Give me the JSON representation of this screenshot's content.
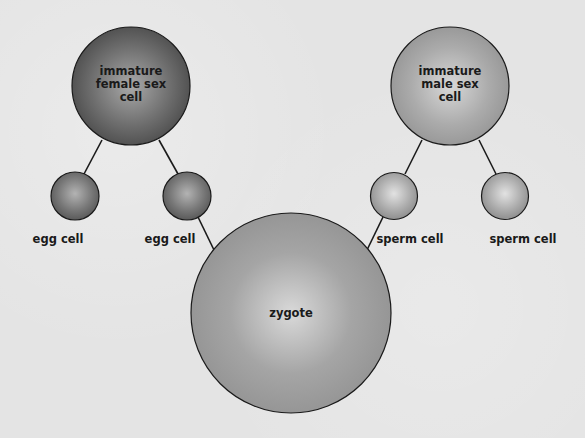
{
  "diagram": {
    "colors": {
      "background": "#e4e4e4",
      "female": "#6e6e6e",
      "male": "#a8a8a8",
      "zygote": "#9c9c9c",
      "stroke": "#1a1a1a"
    },
    "nodes": {
      "female_parent": {
        "label": "immature female sex cell"
      },
      "male_parent": {
        "label": "immature male sex cell"
      },
      "egg_left": {
        "label": "egg cell"
      },
      "egg_right": {
        "label": "egg cell"
      },
      "sperm_left": {
        "label": "sperm cell"
      },
      "sperm_right": {
        "label": "sperm cell"
      },
      "zygote": {
        "label": "zygote"
      }
    },
    "edges": [
      {
        "from": "female_parent",
        "to": "egg_left"
      },
      {
        "from": "female_parent",
        "to": "egg_right"
      },
      {
        "from": "male_parent",
        "to": "sperm_left"
      },
      {
        "from": "male_parent",
        "to": "sperm_right"
      },
      {
        "from": "egg_right",
        "to": "zygote"
      },
      {
        "from": "sperm_left",
        "to": "zygote"
      }
    ]
  }
}
